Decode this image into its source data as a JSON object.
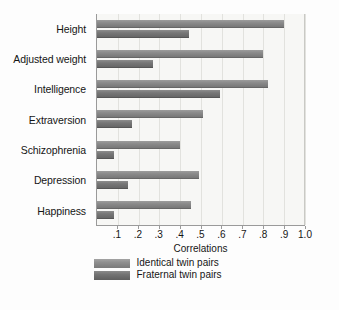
{
  "chart_data": {
    "type": "bar",
    "orientation": "horizontal",
    "title": "",
    "xlabel": "Correlations",
    "ylabel": "",
    "xlim": [
      0,
      1.0
    ],
    "xticks": [
      0.1,
      0.2,
      0.3,
      0.4,
      0.5,
      0.6,
      0.7,
      0.8,
      0.9,
      1.0
    ],
    "xticklabels": [
      ".1",
      ".2",
      ".3",
      ".4",
      ".5",
      ".6",
      ".7",
      ".8",
      ".9",
      "1.0"
    ],
    "grid": true,
    "grid_axis": "x",
    "legend_position": "bottom",
    "categories": [
      "Height",
      "Adjusted weight",
      "Intelligence",
      "Extraversion",
      "Schizophrenia",
      "Depression",
      "Happiness"
    ],
    "series": [
      {
        "name": "Identical twin pairs",
        "color": "#8a8a8a",
        "values": [
          0.9,
          0.8,
          0.82,
          0.51,
          0.4,
          0.49,
          0.45
        ]
      },
      {
        "name": "Fraternal twin pairs",
        "color": "#737373",
        "values": [
          0.44,
          0.27,
          0.59,
          0.17,
          0.08,
          0.15,
          0.08
        ]
      }
    ]
  },
  "axis": {
    "x_title": "Correlations"
  },
  "legend": {
    "items": [
      {
        "label": "Identical twin pairs",
        "swatch": "identical"
      },
      {
        "label": "Fraternal twin pairs",
        "swatch": "fraternal"
      }
    ]
  },
  "colors": {
    "bar_identical": "#8a8a8a",
    "bar_fraternal": "#737373",
    "plot_background": "#f7f7f5",
    "gridline": "#e2e2de",
    "axis_line": "#9a9a9a",
    "text": "#151515"
  }
}
